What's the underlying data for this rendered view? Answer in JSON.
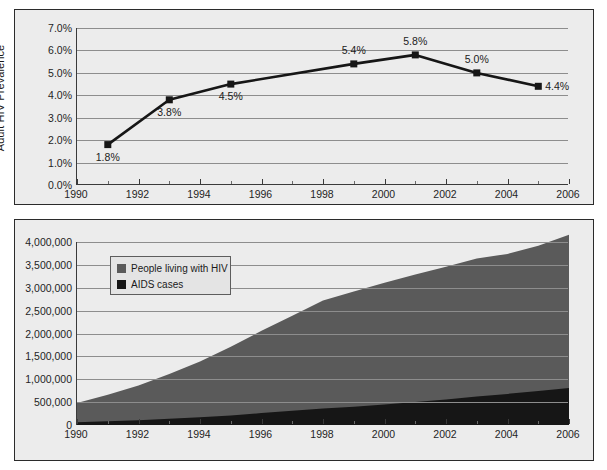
{
  "figure": {
    "background": "#ffffff",
    "panel_background": "#ececec",
    "panel_border_color": "#2b2b2b"
  },
  "colors": {
    "line": "#161616",
    "marker": "#161616",
    "people_living_with_hiv": "#5a5a5a",
    "aids_cases": "#161616",
    "gridline": "#8d8d8d",
    "axis": "#3a3a3a",
    "text": "#1a1a1a",
    "legend_background": "#e4e4e4",
    "legend_border": "#5d5d5d"
  },
  "chart_data": [
    {
      "id": "adult-hiv-prevalence",
      "type": "line",
      "title": "",
      "xlabel": "",
      "ylabel": "Adult HIV Prevalence",
      "xlim": [
        1990,
        2006
      ],
      "ylim": [
        0,
        7
      ],
      "grid": true,
      "legend": "none",
      "y_ticks": [
        0,
        1,
        2,
        3,
        4,
        5,
        6,
        7
      ],
      "y_tick_labels": [
        "0.0%",
        "1.0%",
        "2.0%",
        "3.0%",
        "4.0%",
        "5.0%",
        "6.0%",
        "7.0%"
      ],
      "x_ticks": [
        1990,
        1992,
        1994,
        1996,
        1998,
        2000,
        2002,
        2004,
        2006
      ],
      "x_tick_labels": [
        "1990",
        "1992",
        "1994",
        "1996",
        "1998",
        "2000",
        "2002",
        "2004",
        "2006"
      ],
      "x_minor_ticks": [
        1991,
        1993,
        1995,
        1997,
        1999,
        2001,
        2003,
        2005
      ],
      "x": [
        1991,
        1993,
        1995,
        1999,
        2001,
        2003,
        2005
      ],
      "values": [
        1.8,
        3.8,
        4.5,
        5.4,
        5.8,
        5.0,
        4.4
      ],
      "point_labels": [
        "1.8%",
        "3.8%",
        "4.5%",
        "5.4%",
        "5.8%",
        "5.0%",
        "4.4%"
      ],
      "point_label_positions": [
        "below",
        "below",
        "below",
        "above",
        "above",
        "above",
        "right"
      ],
      "marker": "square",
      "marker_size": 7
    },
    {
      "id": "hiv-aids-burden",
      "type": "area",
      "stacked": true,
      "title": "",
      "xlabel": "",
      "ylabel": "",
      "xlim": [
        1990,
        2006
      ],
      "ylim": [
        0,
        4000000
      ],
      "grid": true,
      "legend_position": "upper-left-inside",
      "y_ticks": [
        0,
        500000,
        1000000,
        1500000,
        2000000,
        2500000,
        3000000,
        3500000,
        4000000
      ],
      "y_tick_labels": [
        "0",
        "500,000",
        "1,000,000",
        "1,500,000",
        "2,000,000",
        "2,500,000",
        "3,000,000",
        "3,500,000",
        "4,000,000"
      ],
      "x_ticks": [
        1990,
        1992,
        1994,
        1996,
        1998,
        2000,
        2002,
        2004,
        2006
      ],
      "x_tick_labels": [
        "1990",
        "1992",
        "1994",
        "1996",
        "1998",
        "2000",
        "2002",
        "2004",
        "2006"
      ],
      "x_minor_ticks": [
        1991,
        1993,
        1995,
        1997,
        1999,
        2001,
        2003,
        2005
      ],
      "x": [
        1990,
        1991,
        1992,
        1993,
        1994,
        1995,
        1996,
        1997,
        1998,
        1999,
        2000,
        2001,
        2002,
        2003,
        2004,
        2005,
        2006
      ],
      "series": [
        {
          "name": "People living with HIV",
          "color": "#5a5a5a",
          "values": [
            420000,
            580000,
            760000,
            980000,
            1220000,
            1500000,
            1800000,
            2080000,
            2360000,
            2520000,
            2660000,
            2790000,
            2900000,
            3020000,
            3060000,
            3180000,
            3350000
          ]
        },
        {
          "name": "AIDS cases",
          "color": "#161616",
          "values": [
            60000,
            80000,
            105000,
            135000,
            170000,
            210000,
            260000,
            310000,
            360000,
            400000,
            450000,
            500000,
            560000,
            620000,
            680000,
            740000,
            810000
          ]
        }
      ]
    }
  ],
  "legend": {
    "items": [
      {
        "label": "People living with HIV",
        "color": "#5a5a5a"
      },
      {
        "label": "AIDS cases",
        "color": "#161616"
      }
    ]
  },
  "axes": {
    "top": {
      "y_title": "Adult HIV Prevalence",
      "y_labels": [
        "7.0%",
        "6.0%",
        "5.0%",
        "4.0%",
        "3.0%",
        "2.0%",
        "1.0%",
        "0.0%"
      ],
      "x_labels": [
        "1990",
        "1992",
        "1994",
        "1996",
        "1998",
        "2000",
        "2002",
        "2004",
        "2006"
      ]
    },
    "bottom": {
      "y_labels": [
        "4,000,000",
        "3,500,000",
        "3,000,000",
        "2,500,000",
        "2,000,000",
        "1,500,000",
        "1,000,000",
        "500,000",
        "0"
      ],
      "x_labels": [
        "1990",
        "1992",
        "1994",
        "1996",
        "1998",
        "2000",
        "2002",
        "2004",
        "2006"
      ]
    }
  },
  "data_labels": {
    "top": [
      "1.8%",
      "3.8%",
      "4.5%",
      "5.4%",
      "5.8%",
      "5.0%",
      "4.4%"
    ]
  }
}
